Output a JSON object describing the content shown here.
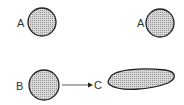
{
  "labels": {
    "a_left": "A",
    "a_right": "A",
    "b": "B",
    "c": "C"
  },
  "colors": {
    "fill": "#c8c8c8",
    "stroke": "#222222"
  }
}
